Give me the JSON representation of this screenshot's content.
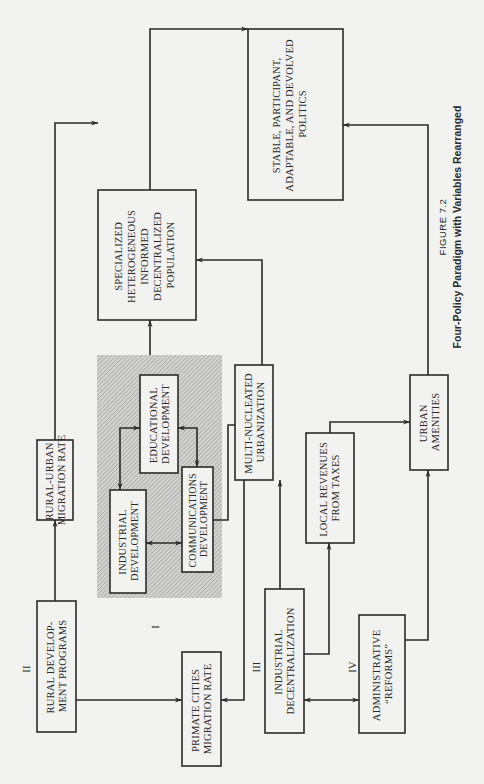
{
  "figure": {
    "number": "FIGURE 7.2",
    "title": "Four-Policy Paradigm with Variables Rearranged"
  },
  "policy_labels": {
    "I": "I",
    "II": "II",
    "III": "III",
    "IV": "IV"
  },
  "boxes": {
    "stable_politics": [
      "STABLE, PARTICIPANT,",
      "ADAPTABLE, AND DEVOLVED",
      "POLITICS"
    ],
    "specialized_population": [
      "SPECIALIZED",
      "HETEROGENEOUS",
      "INFORMED",
      "DECENTRALIZED",
      "POPULATION"
    ],
    "rural_urban_migration": [
      "RURAL-URBAN",
      "MIGRATION RATE"
    ],
    "educational_development": [
      "EDUCATIONAL",
      "DEVELOPMENT"
    ],
    "industrial_development": [
      "INDUSTRIAL",
      "DEVELOPMENT"
    ],
    "communications_development": [
      "COMMUNICATIONS",
      "DEVELOPMENT"
    ],
    "multi_nucleated_urbanization": [
      "MULTI-NUCLEATED",
      "URBANIZATION"
    ],
    "rural_development_programs": [
      "RURAL DEVELOP-",
      "MENT PROGRAMS"
    ],
    "primate_cities_migration": [
      "PRIMATE CITIES",
      "MIGRATION RATE"
    ],
    "industrial_decentralization": [
      "INDUSTRIAL",
      "DECENTRALIZATION"
    ],
    "local_revenues": [
      "LOCAL REVENUES",
      "FROM TAXES"
    ],
    "urban_amenities": [
      "URBAN",
      "AMENITIES"
    ],
    "administrative_reforms": [
      "ADMINISTRATIVE",
      "“REFORMS”"
    ]
  },
  "colors": {
    "ink": "#2a2a2a",
    "paper": "#f2f2f0",
    "shade": "#c9c9c9"
  }
}
